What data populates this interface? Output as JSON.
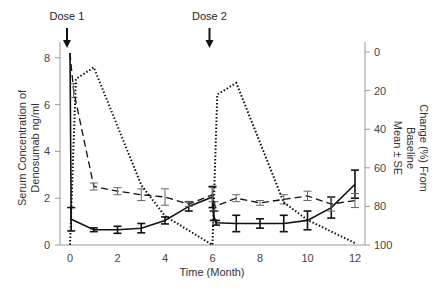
{
  "chart_data": {
    "type": "line",
    "title": "",
    "xlabel": "Time (Month)",
    "ylabel": "Serum Concentration of Denosumab ng/ml",
    "ylabel_lines": [
      "Serum Concentration of",
      "Denosumab ng/ml"
    ],
    "y2label": "Change (%) From Baseline Mean ± SE",
    "y2label_lines": [
      "Change (%) From",
      "Baseline",
      "Mean ± SE"
    ],
    "xlim": [
      0,
      12
    ],
    "ylim": [
      0,
      8
    ],
    "y2lim": [
      0,
      100
    ],
    "y2_inverted": true,
    "x_ticks": [
      0,
      2,
      4,
      6,
      8,
      10,
      12
    ],
    "y_ticks": [
      0,
      2,
      4,
      6,
      8
    ],
    "y2_ticks": [
      0,
      20,
      40,
      60,
      80,
      100
    ],
    "grid": false,
    "legend": null,
    "annotations": [
      {
        "text": "Dose 1",
        "x": 0,
        "arrow": true
      },
      {
        "text": "Dose 2",
        "x": 6,
        "arrow": true
      }
    ],
    "series": [
      {
        "name": "solid",
        "axis": "left",
        "style": "solid",
        "x": [
          0,
          0.05,
          1,
          2,
          3,
          4,
          5,
          6,
          6.05,
          6.15,
          7,
          8,
          9,
          10,
          11,
          12
        ],
        "values": [
          8.2,
          1.1,
          0.65,
          0.65,
          0.72,
          1.05,
          1.65,
          2.05,
          1.25,
          0.95,
          0.92,
          0.92,
          0.92,
          1.05,
          1.6,
          2.6
        ],
        "error": [
          0,
          0.5,
          0.08,
          0.15,
          0.2,
          0.15,
          0.2,
          0.45,
          0.2,
          0.1,
          0.35,
          0.2,
          0.35,
          0.4,
          0.45,
          0.6
        ]
      },
      {
        "name": "dashed",
        "axis": "left",
        "style": "dashed",
        "x": [
          0,
          0.15,
          1,
          2,
          3,
          4,
          5,
          6,
          6.1,
          7,
          8,
          9,
          10,
          11,
          12
        ],
        "values": [
          8.2,
          6.6,
          2.5,
          2.3,
          2.15,
          2.05,
          1.75,
          2.15,
          1.65,
          2.0,
          1.8,
          1.95,
          2.1,
          1.75,
          1.9
        ],
        "error": [
          0,
          0.3,
          0.15,
          0.15,
          0.25,
          0.35,
          0.1,
          0.3,
          0.2,
          0.15,
          0.1,
          0.2,
          0.2,
          0.3,
          0.3
        ]
      },
      {
        "name": "dotted",
        "axis": "right",
        "style": "dotted",
        "x": [
          0,
          0.25,
          1,
          3,
          4,
          6,
          6.2,
          7,
          9,
          10,
          12
        ],
        "values": [
          100,
          14,
          8,
          69,
          85,
          100,
          22,
          16,
          78,
          87,
          99
        ]
      }
    ]
  }
}
